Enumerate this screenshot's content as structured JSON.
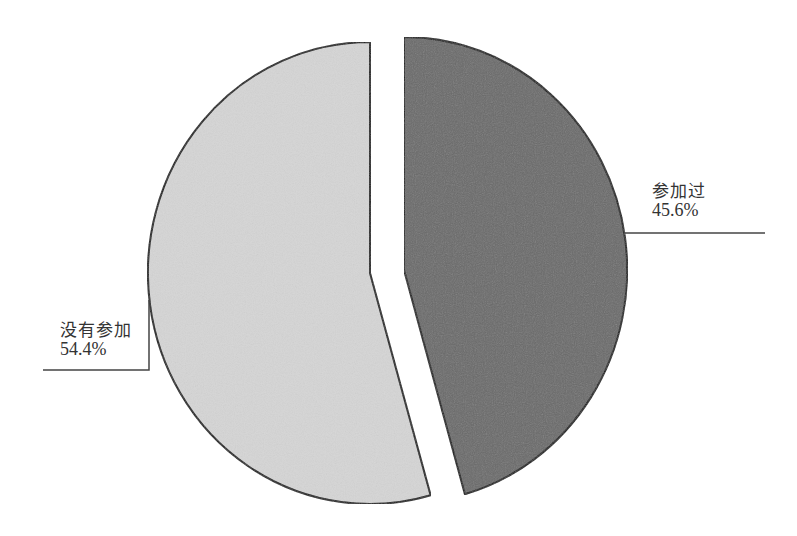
{
  "chart_data": {
    "type": "pie",
    "title": "",
    "slices": [
      {
        "label": "参加过",
        "value": 45.6,
        "display": "45.6%",
        "color": "#6b6b6b",
        "exploded": true
      },
      {
        "label": "没有参加",
        "value": 54.4,
        "display": "54.4%",
        "color": "#d5d5d5",
        "exploded": false
      }
    ],
    "legend": "none",
    "labels_position": "outside with leader lines"
  },
  "labels": {
    "participated": {
      "name": "参加过",
      "percent": "45.6%"
    },
    "not_participated": {
      "name": "没有参加",
      "percent": "54.4%"
    }
  }
}
